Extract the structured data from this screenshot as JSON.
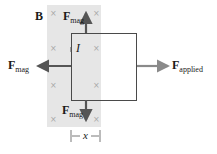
{
  "diagram": {
    "field_label": "B",
    "current_label": "I",
    "width_label": "x",
    "forces": {
      "mag_top": {
        "symbol": "F",
        "subscript": "mag"
      },
      "mag_left": {
        "symbol": "F",
        "subscript": "mag"
      },
      "mag_bottom": {
        "symbol": "F",
        "subscript": "mag"
      },
      "applied": {
        "symbol": "F",
        "subscript": "applied"
      }
    },
    "field_marker": "×",
    "colors": {
      "field_region": "#e6e6e6",
      "loop": "#4a4a4a",
      "mag_arrow": "#555555",
      "applied_arrow": "#8a8a8a",
      "field_marker": "#a8a8a8"
    }
  }
}
